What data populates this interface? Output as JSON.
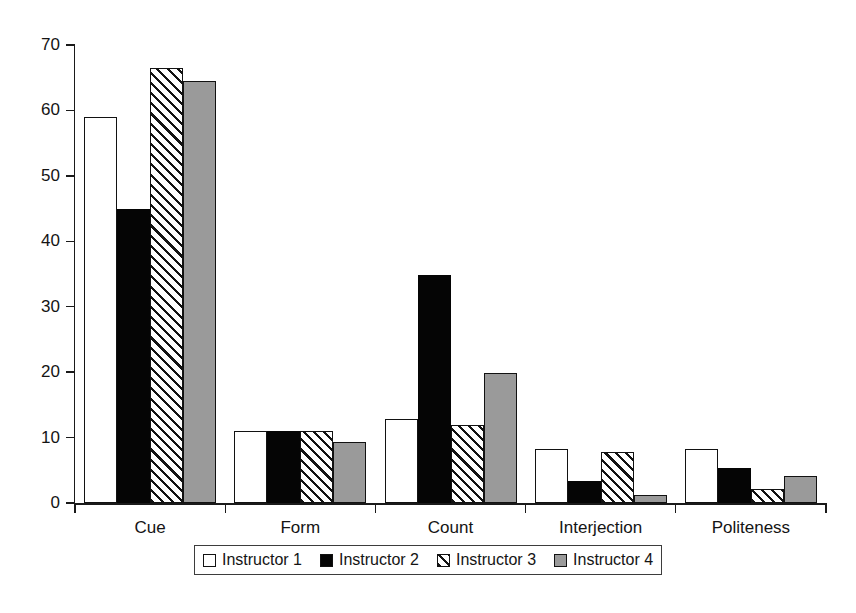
{
  "chart_data": {
    "type": "bar",
    "title": "",
    "subtitle": "",
    "xlabel": "",
    "ylabel": "",
    "ylim": [
      0,
      70
    ],
    "yticks": [
      0,
      10,
      20,
      30,
      40,
      50,
      60,
      70
    ],
    "ytick_labels": [
      "0",
      "10",
      "20",
      "30",
      "40",
      "50",
      "60",
      "70"
    ],
    "grid": false,
    "legend_position": "bottom-center",
    "categories": [
      "Cue",
      "Form",
      "Count",
      "Interjection",
      "Politeness"
    ],
    "series": [
      {
        "name": "Instructor 1",
        "pattern": "open-white",
        "color": "#ffffff",
        "values": [
          59,
          11,
          12.8,
          8.3,
          8.3
        ]
      },
      {
        "name": "Instructor 2",
        "pattern": "solid-black",
        "color": "#050505",
        "values": [
          45,
          11,
          34.9,
          3.4,
          5.3
        ]
      },
      {
        "name": "Instructor 3",
        "pattern": "diagonal-hatch",
        "color": "#ffffff",
        "values": [
          66.5,
          11,
          11.9,
          7.8,
          2.1
        ]
      },
      {
        "name": "Instructor 4",
        "pattern": "solid-gray",
        "color": "#9a9a9a",
        "values": [
          64.5,
          9.4,
          19.8,
          1.2,
          4.2
        ]
      }
    ]
  },
  "legend": {
    "items": [
      {
        "label": "Instructor 1"
      },
      {
        "label": "Instructor 2"
      },
      {
        "label": "Instructor 3"
      },
      {
        "label": "Instructor 4"
      }
    ]
  },
  "caption": {
    "text": ""
  }
}
